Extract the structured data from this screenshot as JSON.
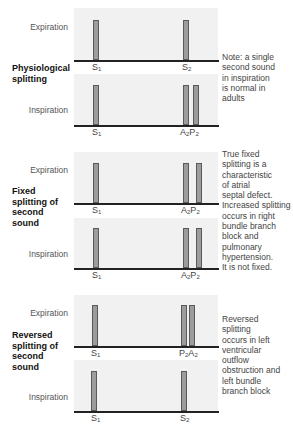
{
  "sections": [
    {
      "title_lines": [
        "Physiological",
        "splitting"
      ],
      "note_lines": [
        "Note: a single",
        "second sound",
        "in inspiration",
        "is normal in",
        "adults"
      ],
      "expiration": {
        "label": "Expiration",
        "sounds": [
          {
            "main": "S",
            "sub": "1"
          },
          {
            "main": "S",
            "sub": "2"
          }
        ]
      },
      "inspiration": {
        "label": "Inspiration",
        "sounds": [
          {
            "main": "S",
            "sub": "1"
          },
          {
            "main": "A",
            "sub": "2",
            "main2": "P",
            "sub2": "2"
          }
        ]
      }
    },
    {
      "title_lines": [
        "Fixed",
        "splitting of",
        "second",
        "sound"
      ],
      "note_lines": [
        "True fixed",
        "splitting is a",
        "characteristic",
        "of atrial",
        "septal defect.",
        "Increased splitting",
        "occurs in right",
        "bundle branch",
        "block and",
        "pulmonary",
        "hypertension.",
        "It is not fixed."
      ],
      "expiration": {
        "label": "Expiration",
        "sounds": [
          {
            "main": "S",
            "sub": "1"
          },
          {
            "main": "A",
            "sub": "2",
            "main2": "P",
            "sub2": "2"
          }
        ]
      },
      "inspiration": {
        "label": "Inspiration",
        "sounds": [
          {
            "main": "S",
            "sub": "1"
          },
          {
            "main": "A",
            "sub": "2",
            "main2": "P",
            "sub2": "2"
          }
        ]
      }
    },
    {
      "title_lines": [
        "Reversed",
        "splitting of",
        "second",
        "sound"
      ],
      "note_lines": [
        "Reversed",
        "splitting",
        "occurs in left",
        "ventricular",
        "outflow",
        "obstruction and",
        "left bundle",
        "branch block"
      ],
      "expiration": {
        "label": "Expiration",
        "sounds": [
          {
            "main": "S",
            "sub": "1"
          },
          {
            "main": "P",
            "sub": "2",
            "main2": "A",
            "sub2": "2"
          }
        ]
      },
      "inspiration": {
        "label": "Inspiration",
        "sounds": [
          {
            "main": "S",
            "sub": "1"
          },
          {
            "main": "S",
            "sub": "2"
          }
        ]
      }
    }
  ],
  "colors": {
    "panel_bg": "#f1f1f1",
    "bar_fill": "#9c9c9c",
    "bar_outline": "#5a5a5a",
    "baseline": "#222222"
  }
}
